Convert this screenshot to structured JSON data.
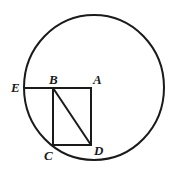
{
  "diagram": {
    "labels": {
      "A": "A",
      "B": "B",
      "C": "C",
      "D": "D",
      "E": "E"
    },
    "shapes": [
      "circle",
      "square ABDC",
      "segment EB",
      "diagonal BD"
    ]
  }
}
